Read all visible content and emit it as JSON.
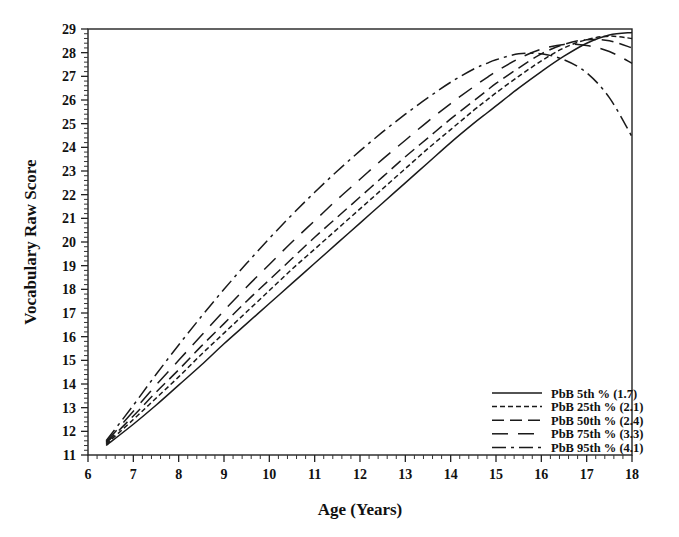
{
  "chart_data": {
    "type": "line",
    "title": "",
    "xlabel": "Age (Years)",
    "ylabel": "Vocabulary Raw Score",
    "xlim": [
      6,
      18
    ],
    "ylim": [
      11,
      29
    ],
    "xticks": [
      6,
      7,
      8,
      9,
      10,
      11,
      12,
      13,
      14,
      15,
      16,
      17,
      18
    ],
    "yticks": [
      11,
      12,
      13,
      14,
      15,
      16,
      17,
      18,
      19,
      20,
      21,
      22,
      23,
      24,
      25,
      26,
      27,
      28,
      29
    ],
    "xtick_labels": [
      "6",
      "7",
      "8",
      "9",
      "10",
      "11",
      "12",
      "13",
      "14",
      "15",
      "16",
      "17",
      "18"
    ],
    "ytick_labels": [
      "11",
      "12",
      "13",
      "14",
      "15",
      "16",
      "17",
      "18",
      "19",
      "20",
      "21",
      "22",
      "23",
      "24",
      "25",
      "26",
      "27",
      "28",
      "29"
    ],
    "x_minor_ticks_per_interval": 5,
    "y_minor_ticks_per_interval": 5,
    "grid": false,
    "frame": true,
    "legend_position": "lower-right-inside",
    "x": [
      6.4,
      7.0,
      7.5,
      8.0,
      8.5,
      9.0,
      9.5,
      10.0,
      10.5,
      11.0,
      11.5,
      12.0,
      12.5,
      13.0,
      13.5,
      14.0,
      14.5,
      14.8,
      15.0,
      15.5,
      16.0,
      16.5,
      17.0,
      17.5,
      18.0
    ],
    "series": [
      {
        "name": "PbB 5th  % (1.7)",
        "label_prefix": "PbB",
        "percentile": "5th",
        "value": "1.7",
        "linestyle": "solid",
        "dasharray": "",
        "color": "#1a1a1a",
        "values": [
          11.4,
          12.3,
          13.1,
          13.95,
          14.8,
          15.7,
          16.55,
          17.4,
          18.25,
          19.1,
          19.95,
          20.8,
          21.65,
          22.5,
          23.35,
          24.2,
          25.0,
          25.45,
          25.75,
          26.5,
          27.2,
          27.85,
          28.4,
          28.75,
          28.85
        ]
      },
      {
        "name": "PbB 25th % (2.1)",
        "label_prefix": "PbB",
        "percentile": "25th",
        "value": "2.1",
        "linestyle": "dotted-fine",
        "dasharray": "5,3",
        "color": "#1a1a1a",
        "values": [
          11.45,
          12.5,
          13.4,
          14.3,
          15.25,
          16.15,
          17.05,
          17.95,
          18.85,
          19.7,
          20.55,
          21.4,
          22.25,
          23.1,
          23.95,
          24.75,
          25.55,
          26.0,
          26.3,
          27.0,
          27.65,
          28.2,
          28.55,
          28.7,
          28.6
        ]
      },
      {
        "name": "PbB 50th % (2.4)",
        "label_prefix": "PbB",
        "percentile": "50th",
        "value": "2.4",
        "linestyle": "dashed-medium",
        "dasharray": "12,6",
        "color": "#1a1a1a",
        "values": [
          11.5,
          12.65,
          13.65,
          14.6,
          15.6,
          16.55,
          17.5,
          18.4,
          19.3,
          20.2,
          21.05,
          21.9,
          22.75,
          23.6,
          24.4,
          25.2,
          25.95,
          26.4,
          26.7,
          27.35,
          27.95,
          28.35,
          28.55,
          28.5,
          28.2
        ]
      },
      {
        "name": "PbB 75th % (3.3)",
        "label_prefix": "PbB",
        "percentile": "75th",
        "value": "3.3",
        "linestyle": "dashed-long",
        "dasharray": "16,10",
        "color": "#1a1a1a",
        "values": [
          11.55,
          12.85,
          13.95,
          15.0,
          16.05,
          17.1,
          18.1,
          19.05,
          20.0,
          20.9,
          21.8,
          22.65,
          23.5,
          24.3,
          25.1,
          25.85,
          26.55,
          26.95,
          27.2,
          27.75,
          28.15,
          28.35,
          28.3,
          28.05,
          27.55
        ]
      },
      {
        "name": "PbB 95th % (4.1)",
        "label_prefix": "PbB",
        "percentile": "95th",
        "value": "4.1",
        "linestyle": "dash-dot",
        "dasharray": "14,5,3,5",
        "color": "#1a1a1a",
        "values": [
          11.6,
          13.1,
          14.4,
          15.65,
          16.85,
          18.0,
          19.1,
          20.15,
          21.15,
          22.1,
          23.0,
          23.85,
          24.65,
          25.4,
          26.1,
          26.75,
          27.3,
          27.55,
          27.7,
          27.95,
          27.95,
          27.7,
          27.15,
          26.1,
          24.45
        ]
      }
    ]
  },
  "legend": {
    "entries": [
      "PbB 5th  % (1.7)",
      "PbB 25th % (2.1)",
      "PbB 50th % (2.4)",
      "PbB 75th % (3.3)",
      "PbB 95th % (4.1)"
    ]
  }
}
